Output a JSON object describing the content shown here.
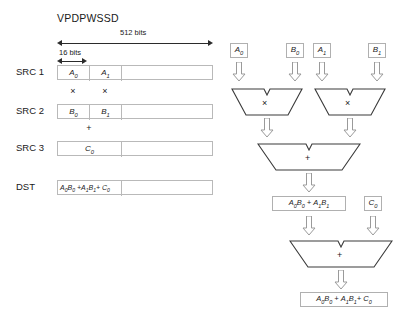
{
  "title": "VPDPWSSD",
  "dimensions": {
    "total_label": "512 bits",
    "element_label": "16 bits"
  },
  "rows": [
    {
      "label": "SRC 1",
      "cells": [
        "A0",
        "A1"
      ]
    },
    {
      "label": "SRC 2",
      "cells": [
        "B0",
        "B1"
      ]
    },
    {
      "label": "SRC 3",
      "cells": [
        "C0"
      ]
    },
    {
      "label": "DST",
      "cells": [
        "A0B0 +A1B1+ C0"
      ]
    }
  ],
  "row_labels": {
    "src1": "SRC 1",
    "src2": "SRC 2",
    "src3": "SRC 3",
    "dst": "DST"
  },
  "cells": {
    "a0": "A",
    "a0_sub": "0",
    "a1": "A",
    "a1_sub": "1",
    "b0": "B",
    "b0_sub": "0",
    "b1": "B",
    "b1_sub": "1",
    "c0": "C",
    "c0_sub": "0"
  },
  "operators": {
    "multiply": "×",
    "add": "+"
  },
  "dataflow": {
    "inputs": [
      {
        "name": "A0",
        "base": "A",
        "sub": "0"
      },
      {
        "name": "B0",
        "base": "B",
        "sub": "0"
      },
      {
        "name": "A1",
        "base": "A",
        "sub": "1"
      },
      {
        "name": "B1",
        "base": "B",
        "sub": "1"
      }
    ],
    "multiplier_symbol": "×",
    "adder_symbol": "+",
    "carry_input": {
      "base": "C",
      "sub": "0"
    },
    "intermediate_result": "A0B0 + A1B1",
    "final_result": "A0B0 + A1B1+ C0"
  },
  "colors": {
    "line": "#2b2b2b",
    "box_border": "#b9b9b9",
    "arrow_outline": "#9a9a9a",
    "unit_outline": "#3a3a3a",
    "background": "#ffffff"
  }
}
